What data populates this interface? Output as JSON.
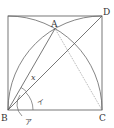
{
  "diagram": {
    "type": "geometry-figure",
    "points": {
      "A": {
        "label": "A",
        "x": 55,
        "y": 28.6
      },
      "B": {
        "label": "B",
        "x": 8,
        "y": 110
      },
      "C": {
        "label": "C",
        "x": 102,
        "y": 110
      },
      "D": {
        "label": "D",
        "x": 102,
        "y": 16
      },
      "TL": {
        "label": "",
        "x": 8,
        "y": 16
      }
    },
    "segments": [
      {
        "from": "B",
        "to": "C",
        "style": "solid"
      },
      {
        "from": "C",
        "to": "D",
        "style": "solid"
      },
      {
        "from": "D",
        "to": "TL",
        "style": "solid"
      },
      {
        "from": "TL",
        "to": "B",
        "style": "solid"
      },
      {
        "from": "B",
        "to": "A",
        "style": "solid"
      },
      {
        "from": "B",
        "to": "D",
        "style": "solid"
      },
      {
        "from": "A",
        "to": "C",
        "style": "dotted"
      }
    ],
    "arcs": [
      {
        "center": "B",
        "radius": "BC",
        "from": "C",
        "to": "TL"
      },
      {
        "center": "C",
        "radius": "CB",
        "from": "B",
        "to": "D"
      }
    ],
    "angle_labels": {
      "x": "x",
      "i": "イ",
      "a": "ア"
    },
    "vertex_labels": {
      "A": "A",
      "B": "B",
      "C": "C",
      "D": "D"
    },
    "colors": {
      "line": "#555555",
      "dotted": "#999999",
      "text": "#333333"
    }
  }
}
